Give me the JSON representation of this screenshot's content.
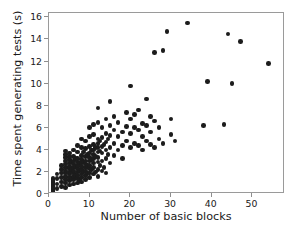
{
  "chart_data": {
    "type": "scatter",
    "title": "",
    "xlabel": "Number of basic blocks",
    "ylabel": "Time spent generating tests (s)",
    "xlim": [
      0,
      58
    ],
    "ylim": [
      0,
      16.4
    ],
    "xticks": [
      0,
      10,
      20,
      30,
      40,
      50
    ],
    "yticks": [
      0,
      2,
      4,
      6,
      8,
      10,
      12,
      14,
      16
    ],
    "grid": false,
    "legend": null,
    "marker": {
      "shape": "circle",
      "color": "#1c1c1c",
      "size": 4.6
    },
    "points": [
      [
        1,
        0.05
      ],
      [
        1,
        0.18
      ],
      [
        1,
        0.3
      ],
      [
        1,
        0.42
      ],
      [
        1,
        0.55
      ],
      [
        1,
        0.68
      ],
      [
        1,
        0.8
      ],
      [
        1,
        0.92
      ],
      [
        1,
        1.05
      ],
      [
        1,
        1.18
      ],
      [
        1,
        1.3
      ],
      [
        1,
        1.42
      ],
      [
        1,
        0.1
      ],
      [
        1,
        0.6
      ],
      [
        1,
        1.0
      ],
      [
        1,
        1.25
      ],
      [
        2,
        0.5
      ],
      [
        2,
        0.9
      ],
      [
        2,
        1.4
      ],
      [
        2,
        1.8
      ],
      [
        3,
        0.7
      ],
      [
        3,
        1.1
      ],
      [
        3,
        1.5
      ],
      [
        3,
        1.9
      ],
      [
        3,
        2.2
      ],
      [
        3,
        2.6
      ],
      [
        4,
        0.6
      ],
      [
        4,
        1.0
      ],
      [
        4,
        1.3
      ],
      [
        4,
        1.6
      ],
      [
        4,
        1.9
      ],
      [
        4,
        2.1
      ],
      [
        4,
        2.4
      ],
      [
        4,
        2.7
      ],
      [
        4,
        3.0
      ],
      [
        4,
        3.3
      ],
      [
        4,
        3.6
      ],
      [
        4,
        3.9
      ],
      [
        5,
        0.8
      ],
      [
        5,
        1.2
      ],
      [
        5,
        1.5
      ],
      [
        5,
        1.8
      ],
      [
        5,
        2.0
      ],
      [
        5,
        2.3
      ],
      [
        5,
        2.5
      ],
      [
        5,
        2.8
      ],
      [
        5,
        3.1
      ],
      [
        5,
        3.4
      ],
      [
        5,
        3.7
      ],
      [
        5.5,
        1.4
      ],
      [
        5.5,
        2.2
      ],
      [
        5.5,
        2.9
      ],
      [
        6,
        0.9
      ],
      [
        6,
        1.3
      ],
      [
        6,
        1.6
      ],
      [
        6,
        1.9
      ],
      [
        6,
        2.1
      ],
      [
        6,
        2.4
      ],
      [
        6,
        2.7
      ],
      [
        6,
        3.0
      ],
      [
        6,
        3.4
      ],
      [
        6,
        4.0
      ],
      [
        6.5,
        1.7
      ],
      [
        6.5,
        2.5
      ],
      [
        6.5,
        3.2
      ],
      [
        7,
        1.0
      ],
      [
        7,
        1.4
      ],
      [
        7,
        1.7
      ],
      [
        7,
        2.0
      ],
      [
        7,
        2.3
      ],
      [
        7,
        2.6
      ],
      [
        7,
        2.9
      ],
      [
        7,
        3.2
      ],
      [
        7,
        3.8
      ],
      [
        7,
        4.4
      ],
      [
        7.5,
        1.2
      ],
      [
        7.5,
        2.1
      ],
      [
        7.5,
        2.8
      ],
      [
        8,
        1.1
      ],
      [
        8,
        1.5
      ],
      [
        8,
        1.8
      ],
      [
        8,
        2.2
      ],
      [
        8,
        2.5
      ],
      [
        8,
        2.8
      ],
      [
        8,
        3.1
      ],
      [
        8,
        3.5
      ],
      [
        8,
        4.2
      ],
      [
        8,
        5.0
      ],
      [
        8.5,
        2.0
      ],
      [
        8.5,
        2.9
      ],
      [
        8.5,
        3.8
      ],
      [
        9,
        1.3
      ],
      [
        9,
        1.7
      ],
      [
        9,
        2.1
      ],
      [
        9,
        2.4
      ],
      [
        9,
        2.7
      ],
      [
        9,
        3.0
      ],
      [
        9,
        3.4
      ],
      [
        9,
        4.1
      ],
      [
        9,
        4.8
      ],
      [
        9.5,
        1.9
      ],
      [
        9.5,
        2.6
      ],
      [
        9.5,
        3.6
      ],
      [
        10,
        1.5
      ],
      [
        10,
        1.9
      ],
      [
        10,
        2.3
      ],
      [
        10,
        2.6
      ],
      [
        10,
        3.0
      ],
      [
        10,
        3.3
      ],
      [
        10,
        3.7
      ],
      [
        10,
        4.3
      ],
      [
        10,
        5.2
      ],
      [
        10,
        6.0
      ],
      [
        10.5,
        2.2
      ],
      [
        10.5,
        3.1
      ],
      [
        10.5,
        4.0
      ],
      [
        11,
        1.8
      ],
      [
        11,
        2.4
      ],
      [
        11,
        2.8
      ],
      [
        11,
        3.2
      ],
      [
        11,
        3.6
      ],
      [
        11,
        4.0
      ],
      [
        11,
        4.5
      ],
      [
        11,
        5.4
      ],
      [
        11,
        6.3
      ],
      [
        11.5,
        2.0
      ],
      [
        11.5,
        3.4
      ],
      [
        11.5,
        4.2
      ],
      [
        12,
        1.6
      ],
      [
        12,
        2.2
      ],
      [
        12,
        2.9
      ],
      [
        12,
        3.3
      ],
      [
        12,
        3.8
      ],
      [
        12,
        4.2
      ],
      [
        12,
        4.6
      ],
      [
        12,
        5.0
      ],
      [
        12,
        6.5
      ],
      [
        12,
        7.8
      ],
      [
        12.5,
        2.6
      ],
      [
        12.5,
        3.9
      ],
      [
        12.5,
        4.8
      ],
      [
        13,
        2.1
      ],
      [
        13,
        3.0
      ],
      [
        13,
        3.7
      ],
      [
        13,
        4.3
      ],
      [
        13,
        5.1
      ],
      [
        13,
        6.0
      ],
      [
        13.5,
        2.4
      ],
      [
        13.5,
        4.5
      ],
      [
        14,
        1.9
      ],
      [
        14,
        3.2
      ],
      [
        14,
        4.0
      ],
      [
        14,
        4.7
      ],
      [
        14,
        5.5
      ],
      [
        14,
        6.8
      ],
      [
        14.5,
        3.6
      ],
      [
        14.5,
        5.0
      ],
      [
        15,
        2.8
      ],
      [
        15,
        4.2
      ],
      [
        15,
        5.3
      ],
      [
        15,
        6.2
      ],
      [
        15,
        8.4
      ],
      [
        16,
        3.5
      ],
      [
        16,
        4.6
      ],
      [
        16,
        5.8
      ],
      [
        16,
        7.0
      ],
      [
        17,
        4.0
      ],
      [
        17,
        5.2
      ],
      [
        17,
        6.5
      ],
      [
        18,
        4.4
      ],
      [
        18,
        5.6
      ],
      [
        18,
        3.2
      ],
      [
        19,
        4.8
      ],
      [
        19,
        6.1
      ],
      [
        19,
        7.4
      ],
      [
        20,
        4.2
      ],
      [
        20,
        5.5
      ],
      [
        20,
        6.8
      ],
      [
        20,
        9.8
      ],
      [
        21,
        4.6
      ],
      [
        21,
        6.0
      ],
      [
        21,
        7.2
      ],
      [
        22,
        4.4
      ],
      [
        22,
        5.8
      ],
      [
        22,
        7.6
      ],
      [
        23,
        4.0
      ],
      [
        23,
        5.2
      ],
      [
        23,
        6.4
      ],
      [
        24,
        4.8
      ],
      [
        24,
        6.2
      ],
      [
        24,
        8.6
      ],
      [
        25,
        4.5
      ],
      [
        25,
        5.6
      ],
      [
        25,
        7.0
      ],
      [
        26,
        4.2
      ],
      [
        26,
        6.6
      ],
      [
        26,
        12.8
      ],
      [
        27,
        5.0
      ],
      [
        27,
        6.0
      ],
      [
        28,
        4.6
      ],
      [
        28,
        13.0
      ],
      [
        29,
        14.7
      ],
      [
        30,
        5.4
      ],
      [
        30,
        6.8
      ],
      [
        31,
        4.8
      ],
      [
        34,
        15.5
      ],
      [
        38,
        6.2
      ],
      [
        39,
        10.2
      ],
      [
        43,
        6.3
      ],
      [
        44,
        14.5
      ],
      [
        45,
        10.0
      ],
      [
        47,
        13.8
      ],
      [
        54,
        11.8
      ]
    ]
  }
}
